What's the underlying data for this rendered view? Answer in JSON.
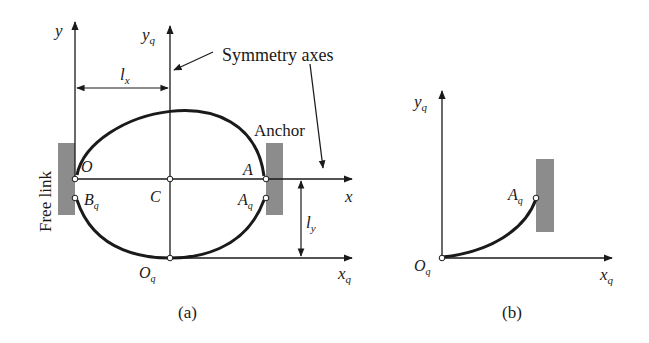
{
  "figure": {
    "panel_a": {
      "caption": "(a)",
      "axis_y": "y",
      "axis_yq": "y",
      "axis_yq_sub": "q",
      "axis_x": "x",
      "axis_xq": "x",
      "axis_xq_sub": "q",
      "dim_lx": "l",
      "dim_lx_sub": "x",
      "dim_ly": "l",
      "dim_ly_sub": "y",
      "symmetry_label": "Symmetry axes",
      "anchor_label": "Anchor",
      "free_link_label": "Free link",
      "point_O": "O",
      "point_C": "C",
      "point_A": "A",
      "point_Bq": "B",
      "point_Bq_sub": "q",
      "point_Aq": "A",
      "point_Aq_sub": "q",
      "point_Oq": "O",
      "point_Oq_sub": "q"
    },
    "panel_b": {
      "caption": "(b)",
      "axis_yq": "y",
      "axis_yq_sub": "q",
      "axis_xq": "x",
      "axis_xq_sub": "q",
      "point_Aq": "A",
      "point_Aq_sub": "q",
      "point_Oq": "O",
      "point_Oq_sub": "q"
    },
    "colors": {
      "line": "#1a1a1a",
      "block": "#8c8c8c"
    }
  }
}
